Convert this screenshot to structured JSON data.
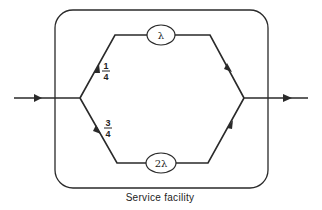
{
  "diagram": {
    "container": {
      "label": "Service facility"
    },
    "branches": [
      {
        "name": "upper",
        "probability_numerator": "1",
        "probability_denominator": "4",
        "server_rate": "λ"
      },
      {
        "name": "lower",
        "probability_numerator": "3",
        "probability_denominator": "4",
        "server_rate": "2λ"
      }
    ],
    "colors": {
      "stroke": "#2a2a2a",
      "background": "#ffffff"
    }
  }
}
